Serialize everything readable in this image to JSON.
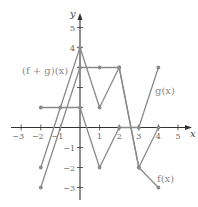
{
  "chart_data": {
    "type": "line",
    "title": "",
    "xlabel": "x",
    "ylabel": "y",
    "xlim": [
      -3.5,
      5.5
    ],
    "ylim": [
      -3.5,
      5.5
    ],
    "grid": false,
    "x_ticks": [
      -3,
      -2,
      -1,
      1,
      2,
      3,
      4,
      5
    ],
    "y_ticks": [
      -3,
      -2,
      -1,
      1,
      2,
      3,
      4,
      5
    ],
    "x_tick_labels": [
      "−3",
      "−2",
      "−1",
      "1",
      "2",
      "3",
      "4",
      "5"
    ],
    "y_tick_labels": [
      "−3",
      "−2",
      "−1",
      "",
      "",
      "",
      "4",
      "5"
    ],
    "series": [
      {
        "name": "f(x)",
        "label": "f(x)",
        "points": [
          [
            -2,
            -3
          ],
          [
            0,
            3
          ],
          [
            1,
            3
          ],
          [
            2,
            3
          ],
          [
            3,
            -2
          ],
          [
            4,
            -3
          ]
        ]
      },
      {
        "name": "g(x)",
        "label": "g(x)",
        "points": [
          [
            -2,
            1
          ],
          [
            -1,
            1
          ],
          [
            0,
            1
          ],
          [
            1,
            -2
          ],
          [
            2,
            0
          ],
          [
            3,
            0
          ],
          [
            4,
            3
          ]
        ]
      },
      {
        "name": "(f + g)(x)",
        "label": "(f + g)(x)",
        "points": [
          [
            -2,
            -2
          ],
          [
            0,
            4
          ],
          [
            1,
            1
          ],
          [
            2,
            3
          ],
          [
            3,
            -2
          ],
          [
            4,
            0
          ]
        ]
      }
    ],
    "colors": {
      "series": "#8a8a8a",
      "axis": "#333333",
      "tick_label": "#666666"
    }
  }
}
